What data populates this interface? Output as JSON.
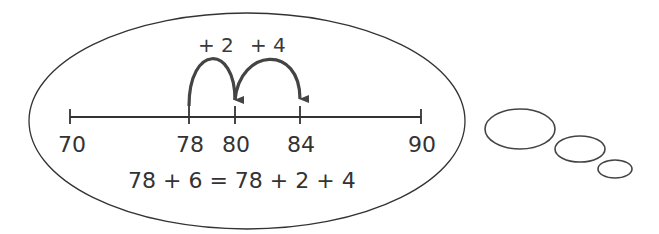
{
  "diagram": {
    "type": "thought-bubble-number-line",
    "colors": {
      "stroke": "#333333",
      "arc": "#444444",
      "background": "#ffffff"
    },
    "number_line": {
      "start_label": "70",
      "end_label": "90",
      "tick_labels": [
        "70",
        "78",
        "80",
        "84",
        "90"
      ]
    },
    "jumps": [
      {
        "label": "+ 2",
        "from": "78",
        "to": "80"
      },
      {
        "label": "+ 4",
        "from": "80",
        "to": "84"
      }
    ],
    "equation": "78 + 6 = 78 + 2 + 4",
    "thought_bubbles": [
      "large",
      "medium",
      "small"
    ]
  }
}
